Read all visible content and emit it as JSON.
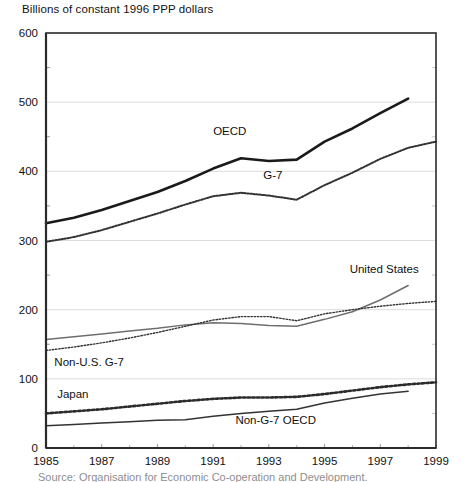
{
  "axis_title": "Billions of constant 1996 PPP dollars",
  "footnote": "Source: Organisation for Economic Co-operation and Development.",
  "colors": {
    "oecd": "#1a1a1a",
    "g7": "#3a3a3a",
    "united_states": "#6e6e6e",
    "non_us_g7": "#5a5a5a",
    "japan": "#2b2b2b",
    "non_g7_oecd": "#6e6e6e",
    "axis": "#2b2b2b",
    "grid": "#dcdcdc",
    "background": "#ffffff"
  },
  "chart_data": {
    "type": "line",
    "title": "",
    "subtitle": "",
    "xlabel": "",
    "ylabel": "Billions of constant 1996 PPP dollars",
    "xlim": [
      1985,
      1999
    ],
    "ylim": [
      0,
      600
    ],
    "ytick_values": [
      0,
      100,
      200,
      300,
      400,
      500,
      600
    ],
    "ytick_labels": [
      "0",
      "100",
      "200",
      "300",
      "400",
      "500",
      "600"
    ],
    "yminor_values": [
      50,
      150,
      250,
      350,
      450,
      550
    ],
    "xtick_values": [
      1985,
      1987,
      1989,
      1991,
      1993,
      1995,
      1997,
      1999
    ],
    "xtick_labels": [
      "1985",
      "1987",
      "1989",
      "1991",
      "1993",
      "1995",
      "1997",
      "1999"
    ],
    "xminor_values": [
      1986,
      1988,
      1990,
      1992,
      1994,
      1996,
      1998
    ],
    "grid": "horizontal-major",
    "legend": "inline-annotations",
    "x": [
      1985,
      1986,
      1987,
      1988,
      1989,
      1990,
      1991,
      1992,
      1993,
      1994,
      1995,
      1996,
      1997,
      1998,
      1999
    ],
    "series": [
      {
        "name": "OECD",
        "style": "solid-thick",
        "label_x": 1991.0,
        "label_y": 452,
        "x": [
          1985,
          1986,
          1987,
          1988,
          1989,
          1990,
          1991,
          1992,
          1993,
          1994,
          1995,
          1996,
          1997,
          1998
        ],
        "values": [
          325,
          333,
          344,
          357,
          370,
          386,
          404,
          419,
          415,
          417,
          443,
          462,
          484,
          505
        ]
      },
      {
        "name": "G-7",
        "style": "dotted-medium",
        "label_x": 1992.8,
        "label_y": 389,
        "x": [
          1985,
          1986,
          1987,
          1988,
          1989,
          1990,
          1991,
          1992,
          1993,
          1994,
          1995,
          1996,
          1997,
          1998,
          1999
        ],
        "values": [
          298,
          305,
          315,
          327,
          339,
          352,
          364,
          369,
          365,
          359,
          380,
          398,
          418,
          434,
          443
        ]
      },
      {
        "name": "United States",
        "style": "solid-medium",
        "label_x": 1995.9,
        "label_y": 253,
        "x": [
          1985,
          1986,
          1987,
          1988,
          1989,
          1990,
          1991,
          1992,
          1993,
          1994,
          1995,
          1996,
          1997,
          1998
        ],
        "values": [
          157,
          161,
          165,
          169,
          173,
          178,
          181,
          180,
          177,
          176,
          186,
          197,
          214,
          235
        ]
      },
      {
        "name": "Non-U.S. G-7",
        "style": "dotted-fine",
        "label_x": 1985.3,
        "label_y": 118,
        "x": [
          1985,
          1986,
          1987,
          1988,
          1989,
          1990,
          1991,
          1992,
          1993,
          1994,
          1995,
          1996,
          1997,
          1998,
          1999
        ],
        "values": [
          141,
          146,
          152,
          159,
          167,
          176,
          185,
          190,
          190,
          184,
          194,
          200,
          205,
          209,
          212
        ]
      },
      {
        "name": "Japan",
        "style": "dotted-bold",
        "label_x": 1985.4,
        "label_y": 73,
        "x": [
          1985,
          1986,
          1987,
          1988,
          1989,
          1990,
          1991,
          1992,
          1993,
          1994,
          1995,
          1996,
          1997,
          1998,
          1999
        ],
        "values": [
          50,
          53,
          56,
          60,
          64,
          68,
          71,
          73,
          73,
          74,
          78,
          83,
          88,
          92,
          95
        ]
      },
      {
        "name": "Non-G-7 OECD",
        "style": "solid-medium",
        "label_x": 1991.8,
        "label_y": 35,
        "x": [
          1985,
          1986,
          1987,
          1988,
          1989,
          1990,
          1991,
          1992,
          1993,
          1994,
          1995,
          1996,
          1997,
          1998
        ],
        "values": [
          32,
          34,
          36,
          38,
          40,
          41,
          46,
          50,
          53,
          56,
          65,
          72,
          78,
          82
        ]
      }
    ]
  }
}
